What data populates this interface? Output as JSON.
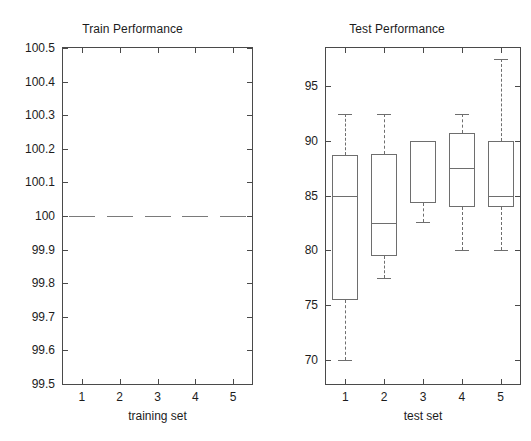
{
  "figure": {
    "background": "#ffffff",
    "line_color": "#6e6e6e",
    "axis_color": "#4a4a4a"
  },
  "panels": {
    "train": {
      "title": "Train Performance",
      "xlabel": "training set",
      "yticks": [
        "99.5",
        "99.6",
        "99.7",
        "99.8",
        "99.9",
        "100",
        "100.1",
        "100.2",
        "100.3",
        "100.4",
        "100.5"
      ],
      "xticks": [
        "1",
        "2",
        "3",
        "4",
        "5"
      ]
    },
    "test": {
      "title": "Test Performance",
      "xlabel": "test set",
      "yticks": [
        "70",
        "75",
        "80",
        "85",
        "90",
        "95"
      ],
      "xticks": [
        "1",
        "2",
        "3",
        "4",
        "5"
      ]
    }
  },
  "chart_data": [
    {
      "type": "box",
      "title": "Train Performance",
      "xlabel": "training set",
      "ylabel": "",
      "ylim": [
        99.5,
        100.5
      ],
      "ytick_values": [
        99.5,
        99.6,
        99.7,
        99.8,
        99.9,
        100.0,
        100.1,
        100.2,
        100.3,
        100.4,
        100.5
      ],
      "grid": false,
      "legend": "none",
      "categories": [
        "1",
        "2",
        "3",
        "4",
        "5"
      ],
      "boxes": [
        {
          "category": "1",
          "whisker_low": 100.0,
          "q1": 100.0,
          "median": 100.0,
          "q3": 100.0,
          "whisker_high": 100.0,
          "degenerate": true
        },
        {
          "category": "2",
          "whisker_low": 100.0,
          "q1": 100.0,
          "median": 100.0,
          "q3": 100.0,
          "whisker_high": 100.0,
          "degenerate": true
        },
        {
          "category": "3",
          "whisker_low": 100.0,
          "q1": 100.0,
          "median": 100.0,
          "q3": 100.0,
          "whisker_high": 100.0,
          "degenerate": true
        },
        {
          "category": "4",
          "whisker_low": 100.0,
          "q1": 100.0,
          "median": 100.0,
          "q3": 100.0,
          "whisker_high": 100.0,
          "degenerate": true
        },
        {
          "category": "5",
          "whisker_low": 100.0,
          "q1": 100.0,
          "median": 100.0,
          "q3": 100.0,
          "whisker_high": 100.0,
          "degenerate": true
        }
      ]
    },
    {
      "type": "box",
      "title": "Test Performance",
      "xlabel": "test set",
      "ylabel": "",
      "ylim": [
        67.8,
        98.5
      ],
      "ytick_values": [
        70,
        75,
        80,
        85,
        90,
        95
      ],
      "grid": false,
      "legend": "none",
      "categories": [
        "1",
        "2",
        "3",
        "4",
        "5"
      ],
      "boxes": [
        {
          "category": "1",
          "whisker_low": 70.0,
          "q1": 75.5,
          "median": 85.0,
          "q3": 88.7,
          "whisker_high": 92.5,
          "degenerate": false
        },
        {
          "category": "2",
          "whisker_low": 77.5,
          "q1": 79.5,
          "median": 82.5,
          "q3": 88.8,
          "whisker_high": 92.5,
          "degenerate": false
        },
        {
          "category": "3",
          "whisker_low": 82.6,
          "q1": 84.3,
          "median": 90.0,
          "q3": 90.0,
          "whisker_high": 82.6,
          "degenerate": false
        },
        {
          "category": "4",
          "whisker_low": 80.0,
          "q1": 84.0,
          "median": 87.5,
          "q3": 90.7,
          "whisker_high": 92.5,
          "degenerate": false
        },
        {
          "category": "5",
          "whisker_low": 80.0,
          "q1": 84.0,
          "median": 85.0,
          "q3": 90.0,
          "whisker_high": 97.5,
          "degenerate": false
        }
      ]
    }
  ]
}
